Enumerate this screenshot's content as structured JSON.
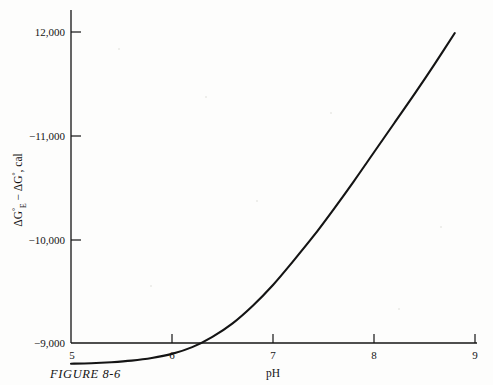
{
  "figure": {
    "caption": "FIGURE 8-6",
    "background_color": "#fdfdfc",
    "ink_color": "#141414"
  },
  "chart_data": {
    "type": "line",
    "title": "",
    "xlabel": "pH",
    "ylabel": "ΔG°E − ΔG°, cal",
    "ylabel_parts": {
      "delta1": "ΔG",
      "sup1": "°",
      "sub1": "E",
      "minus": " − ",
      "delta2": "ΔG",
      "sup2": "°",
      "units": ", cal"
    },
    "xlim": [
      5,
      9
    ],
    "ylim": [
      -9000,
      -12000
    ],
    "xticks": [
      5,
      6,
      7,
      8,
      9
    ],
    "xtick_labels": [
      "5",
      "6",
      "7",
      "8",
      "9"
    ],
    "yticks": [
      -9000,
      -10000,
      -11000,
      -12000
    ],
    "ytick_labels": [
      "−9,000",
      "−10,000",
      "−11,000",
      "12,000"
    ],
    "grid": false,
    "legend": null,
    "series": [
      {
        "name": "ΔG°E − ΔG° vs pH",
        "color": "#141414",
        "x": [
          5.0,
          5.2,
          5.4,
          5.6,
          5.8,
          6.0,
          6.2,
          6.4,
          6.6,
          6.8,
          7.0,
          7.2,
          7.4,
          7.6,
          7.8,
          8.0,
          8.2,
          8.4,
          8.6,
          8.8
        ],
        "y": [
          -8800,
          -8805,
          -8815,
          -8830,
          -8855,
          -8895,
          -8960,
          -9060,
          -9190,
          -9360,
          -9560,
          -9790,
          -10030,
          -10290,
          -10560,
          -10840,
          -11120,
          -11400,
          -11690,
          -11990
        ]
      }
    ]
  }
}
